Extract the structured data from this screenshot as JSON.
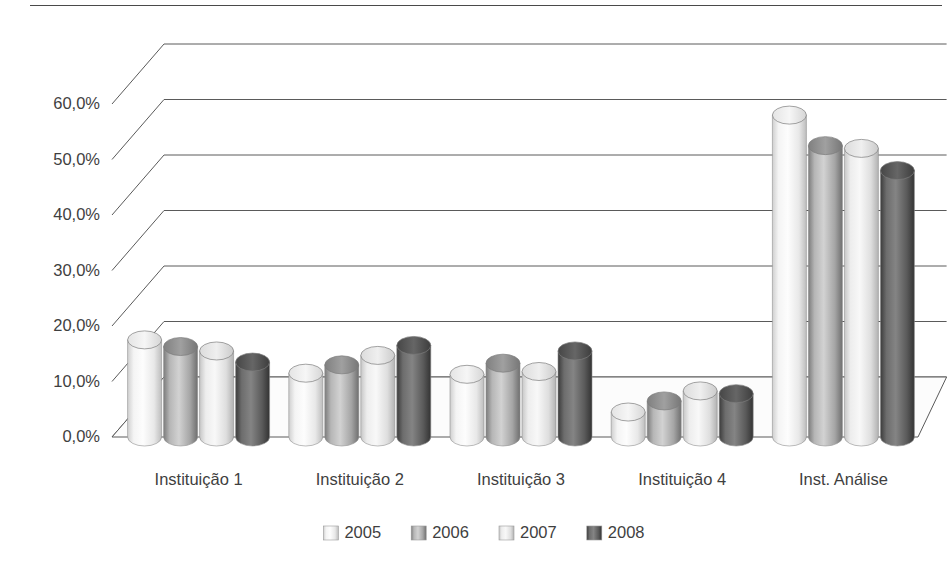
{
  "chart_data": {
    "type": "bar",
    "title": "",
    "subtitle": "",
    "xlabel": "",
    "ylabel": "",
    "categories": [
      "Instituição 1",
      "Instituição 2",
      "Instituição 3",
      "Instituição 4",
      "Inst. Análise"
    ],
    "series": [
      {
        "name": "2005",
        "values": [
          17.5,
          11.5,
          11.3,
          4.5,
          58.0
        ],
        "color": "#eeeeee"
      },
      {
        "name": "2006",
        "values": [
          16.3,
          13.0,
          13.3,
          6.5,
          52.5
        ],
        "color": "#9a9a9a"
      },
      {
        "name": "2007",
        "values": [
          15.5,
          14.7,
          11.8,
          8.3,
          52.0
        ],
        "color": "#e2e2e2"
      },
      {
        "name": "2008",
        "values": [
          13.5,
          16.5,
          15.5,
          7.8,
          48.0
        ],
        "color": "#585858"
      }
    ],
    "ylim": [
      0,
      60
    ],
    "ytick_values": [
      0,
      10,
      20,
      30,
      40,
      50,
      60
    ],
    "ytick_labels": [
      "0,0%",
      "10,0%",
      "20,0%",
      "30,0%",
      "40,0%",
      "50,0%",
      "60,0%"
    ],
    "grid": true,
    "legend_position": "bottom",
    "style": "3d-cylinder",
    "value_suffix": "%"
  },
  "legend": {
    "entries": [
      "2005",
      "2006",
      "2007",
      "2008"
    ]
  },
  "axes": {
    "y_tick_labels": [
      "60,0%",
      "50,0%",
      "40,0%",
      "30,0%",
      "20,0%",
      "10,0%",
      "0,0%"
    ],
    "x_category_labels": [
      "Instituição 1",
      "Instituição 2",
      "Instituição 3",
      "Instituição 4",
      "Inst. Análise"
    ]
  }
}
